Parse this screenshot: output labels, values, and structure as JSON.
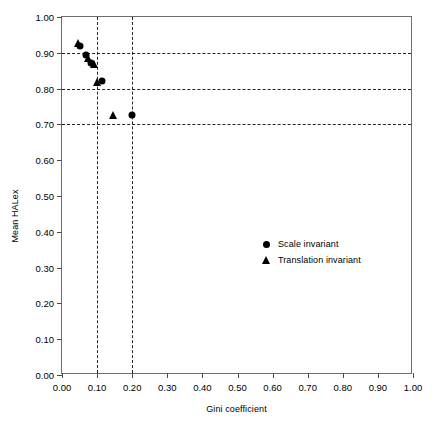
{
  "chart_data": {
    "type": "scatter",
    "title": "",
    "xlabel": "Gini coefficient",
    "ylabel": "Mean HALex",
    "xlim": [
      0.0,
      1.0
    ],
    "ylim": [
      0.0,
      1.0
    ],
    "grid": true,
    "grid_x_values": [
      0.1,
      0.2
    ],
    "grid_y_values": [
      0.9,
      0.8,
      0.7
    ],
    "xticks": [
      "0.00",
      "0.10",
      "0.20",
      "0.30",
      "0.40",
      "0.50",
      "0.60",
      "0.70",
      "0.80",
      "0.90",
      "1.00"
    ],
    "xtick_values": [
      0.0,
      0.1,
      0.2,
      0.3,
      0.4,
      0.5,
      0.6,
      0.7,
      0.8,
      0.9,
      1.0
    ],
    "yticks": [
      "0.00",
      "0.10",
      "0.20",
      "0.30",
      "0.40",
      "0.50",
      "0.60",
      "0.70",
      "0.80",
      "0.90",
      "1.00"
    ],
    "ytick_values": [
      0.0,
      0.1,
      0.2,
      0.3,
      0.4,
      0.5,
      0.6,
      0.7,
      0.8,
      0.9,
      1.0
    ],
    "legend_position": "center",
    "series": [
      {
        "name": "Scale invariant",
        "marker": "circle",
        "color": "#000000",
        "points": [
          {
            "x": 0.052,
            "y": 0.918
          },
          {
            "x": 0.069,
            "y": 0.893
          },
          {
            "x": 0.082,
            "y": 0.872
          },
          {
            "x": 0.115,
            "y": 0.82
          },
          {
            "x": 0.2,
            "y": 0.726
          }
        ]
      },
      {
        "name": "Translation invariant",
        "marker": "triangle",
        "color": "#000000",
        "points": [
          {
            "x": 0.046,
            "y": 0.928
          },
          {
            "x": 0.074,
            "y": 0.886
          },
          {
            "x": 0.09,
            "y": 0.868
          },
          {
            "x": 0.1,
            "y": 0.818
          },
          {
            "x": 0.145,
            "y": 0.725
          }
        ]
      }
    ]
  },
  "legend": {
    "items": [
      {
        "label": "Scale invariant",
        "marker": "circle"
      },
      {
        "label": "Translation invariant",
        "marker": "triangle"
      }
    ]
  }
}
